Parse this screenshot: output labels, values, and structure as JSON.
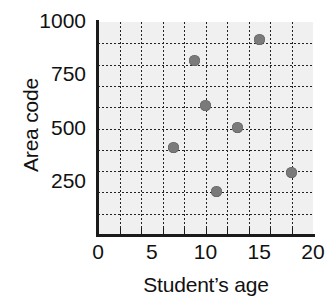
{
  "chart_data": {
    "type": "scatter",
    "title": "",
    "xlabel": "Student’s age",
    "ylabel": "Area code",
    "xlim": [
      0,
      20
    ],
    "ylim": [
      0,
      1000
    ],
    "xticks": [
      0,
      5,
      10,
      15,
      20
    ],
    "yticks": [
      250,
      500,
      750,
      1000
    ],
    "xtick_labels": [
      "0",
      "5",
      "10",
      "15",
      "20"
    ],
    "ytick_labels": [
      "250",
      "500",
      "750",
      "1000"
    ],
    "grid": true,
    "grid_style": "dotted",
    "grid_x_step": 2,
    "grid_y_step": 100,
    "legend": null,
    "point_color": "#7a7a7a",
    "plot_background": "#f0f0f0",
    "axis_color": "#1a1a1a",
    "points": [
      {
        "x": 7,
        "y": 410
      },
      {
        "x": 9,
        "y": 820
      },
      {
        "x": 10,
        "y": 610
      },
      {
        "x": 11,
        "y": 205
      },
      {
        "x": 13,
        "y": 505
      },
      {
        "x": 15,
        "y": 920
      },
      {
        "x": 18,
        "y": 295
      }
    ]
  }
}
